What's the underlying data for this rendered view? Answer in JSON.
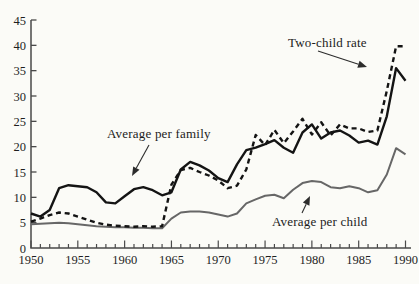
{
  "figure": {
    "background": "#fbfbf7",
    "axis_color": "#4a4a4a",
    "text_color": "#1e1e1e",
    "annotation_arrow_color": "#2c2c2c"
  },
  "chart_data": {
    "type": "line",
    "title": "",
    "xlabel": "",
    "ylabel": "",
    "grid": false,
    "legend_position": "inline-annotations",
    "xlim": [
      1950,
      1990
    ],
    "ylim": [
      0,
      45
    ],
    "y_ticks": [
      0,
      5,
      10,
      15,
      20,
      25,
      30,
      35,
      40,
      45
    ],
    "x_major_ticks": [
      1950,
      1955,
      1960,
      1965,
      1970,
      1975,
      1980,
      1985,
      1990
    ],
    "x_minor_step": 1,
    "x": [
      1950,
      1951,
      1952,
      1953,
      1954,
      1955,
      1956,
      1957,
      1958,
      1959,
      1960,
      1961,
      1962,
      1963,
      1964,
      1965,
      1966,
      1967,
      1968,
      1969,
      1970,
      1971,
      1972,
      1973,
      1974,
      1975,
      1976,
      1977,
      1978,
      1979,
      1980,
      1981,
      1982,
      1983,
      1984,
      1985,
      1986,
      1987,
      1988,
      1989,
      1990
    ],
    "series": [
      {
        "name": "Average per child",
        "style": "solid",
        "color": "#676767",
        "width": 2.0,
        "values": [
          4.7,
          4.8,
          4.9,
          5.0,
          4.9,
          4.7,
          4.5,
          4.3,
          4.2,
          4.1,
          4.1,
          4.0,
          4.0,
          3.9,
          3.9,
          5.8,
          7.0,
          7.2,
          7.2,
          7.0,
          6.6,
          6.2,
          6.8,
          8.8,
          9.6,
          10.3,
          10.5,
          9.8,
          11.5,
          12.8,
          13.2,
          13.0,
          12.0,
          11.8,
          12.2,
          11.8,
          11.0,
          11.4,
          14.5,
          19.7,
          18.5
        ]
      },
      {
        "name": "Average per family",
        "style": "solid",
        "color": "#141414",
        "width": 2.4,
        "values": [
          6.8,
          6.2,
          7.5,
          11.8,
          12.4,
          12.2,
          12.0,
          11.0,
          9.0,
          8.8,
          10.2,
          11.6,
          12.0,
          11.4,
          10.4,
          11.0,
          15.5,
          17.0,
          16.3,
          15.3,
          13.8,
          13.0,
          16.5,
          19.3,
          19.8,
          20.5,
          21.3,
          19.8,
          18.8,
          22.8,
          24.4,
          21.6,
          22.8,
          23.2,
          22.2,
          20.8,
          21.2,
          20.4,
          26.0,
          35.5,
          33.0
        ]
      },
      {
        "name": "Two-child rate",
        "style": "dashed",
        "color": "#141414",
        "width": 2.4,
        "values": [
          5.2,
          5.8,
          6.5,
          7.0,
          6.8,
          6.2,
          5.6,
          5.0,
          4.6,
          4.4,
          4.3,
          4.2,
          4.3,
          4.2,
          4.3,
          12.5,
          15.4,
          15.8,
          15.0,
          14.3,
          13.3,
          11.8,
          12.3,
          15.5,
          22.3,
          20.3,
          23.3,
          20.7,
          23.0,
          25.5,
          22.4,
          24.8,
          22.2,
          24.4,
          23.6,
          23.6,
          22.9,
          23.2,
          31.0,
          39.8,
          39.8
        ]
      }
    ]
  },
  "annotations": [
    {
      "label": "Two-child rate",
      "text_x": 288,
      "text_y": 35,
      "arrow": {
        "x1": 318,
        "y1": 51,
        "x2": 367,
        "y2": 67
      }
    },
    {
      "label": "Average per family",
      "text_x": 107,
      "text_y": 126,
      "arrow": {
        "x1": 149,
        "y1": 145,
        "x2": 132,
        "y2": 176
      }
    },
    {
      "label": "Average per child",
      "text_x": 272,
      "text_y": 214,
      "arrow": {
        "x1": 302,
        "y1": 213,
        "x2": 310,
        "y2": 196
      }
    }
  ]
}
